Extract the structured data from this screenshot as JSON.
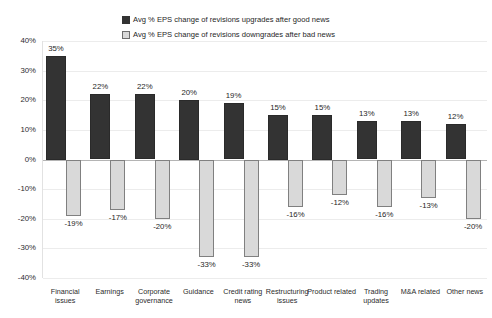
{
  "chart_data": {
    "type": "bar",
    "title": "",
    "subtitle": "",
    "xlabel": "",
    "ylabel": "",
    "ylim": [
      -40,
      40
    ],
    "ytick_labels": [
      "40%",
      "30%",
      "20%",
      "10%",
      "0%",
      "-10%",
      "-20%",
      "-30%",
      "-40%"
    ],
    "ytick_values": [
      40,
      30,
      20,
      10,
      0,
      -10,
      -20,
      -30,
      -40
    ],
    "grid": true,
    "legend_position": "top-center",
    "categories": [
      "Financial issues",
      "Earnings",
      "Corporate governance",
      "Guidance",
      "Credit rating news",
      "Restructuring issues",
      "Product related",
      "Trading updates",
      "M&A related",
      "Other news"
    ],
    "series": [
      {
        "name": "Avg % EPS change of revisions upgrades after good news",
        "color": "#333333",
        "values": [
          35,
          22,
          22,
          20,
          19,
          15,
          15,
          13,
          13,
          12
        ],
        "labels": [
          "35%",
          "22%",
          "22%",
          "20%",
          "19%",
          "15%",
          "15%",
          "13%",
          "13%",
          "12%"
        ]
      },
      {
        "name": "Avg % EPS change of revisions downgrades after bad news",
        "color": "#d9d9d9",
        "values": [
          -19,
          -17,
          -20,
          -33,
          -33,
          -16,
          -12,
          -16,
          -13,
          -20
        ],
        "labels": [
          "-19%",
          "-17%",
          "-20%",
          "-33%",
          "-33%",
          "-16%",
          "-12%",
          "-16%",
          "-13%",
          "-20%"
        ]
      }
    ]
  },
  "legend": {
    "items": [
      {
        "label": "Avg % EPS change of revisions upgrades after good news",
        "marker": "square-dark"
      },
      {
        "label": "Avg % EPS change of revisions downgrades after bad news",
        "marker": "square-light"
      }
    ]
  }
}
